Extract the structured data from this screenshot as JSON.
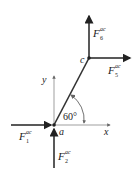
{
  "diagram": {
    "points": {
      "a": "a",
      "c": "c"
    },
    "axes": {
      "x": "x",
      "y": "y"
    },
    "angle": "60°",
    "forces": [
      {
        "id": "F1",
        "base": "F",
        "sub": "1",
        "sup": "ac",
        "direction": "right, into a"
      },
      {
        "id": "F2",
        "base": "F",
        "sub": "2",
        "sup": "ac",
        "direction": "up, into a"
      },
      {
        "id": "F5",
        "base": "F",
        "sub": "5",
        "sup": "ac",
        "direction": "right, from c"
      },
      {
        "id": "F6",
        "base": "F",
        "sub": "6",
        "sup": "ac",
        "direction": "up, from c"
      }
    ],
    "colors": {
      "line": "#333333",
      "axis": "#888888"
    }
  }
}
